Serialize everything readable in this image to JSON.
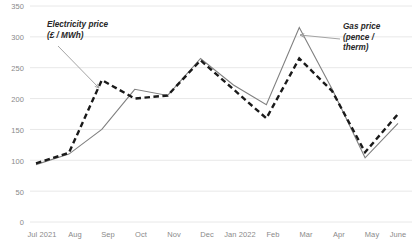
{
  "chart_data": {
    "type": "line",
    "title": "",
    "xlabel": "",
    "ylabel": "",
    "ylim": [
      0,
      350
    ],
    "yticks": [
      0,
      50,
      100,
      150,
      200,
      250,
      300,
      350
    ],
    "grid": true,
    "legend_position": "annotations",
    "categories": [
      "Jul 2021",
      "Aug",
      "Sep",
      "Oct",
      "Nov",
      "Dec",
      "Jan 2022",
      "Feb",
      "Mar",
      "Apr",
      "May",
      "June"
    ],
    "series": [
      {
        "name": "Gas price (pence / therm)",
        "style": "solid",
        "color": "#808080",
        "values": [
          93,
          110,
          150,
          215,
          205,
          265,
          222,
          190,
          315,
          215,
          104,
          160
        ]
      },
      {
        "name": "Electricity price (£ / MWh)",
        "style": "dashed",
        "color": "#1a1a1a",
        "values": [
          95,
          112,
          230,
          200,
          205,
          262,
          215,
          168,
          265,
          212,
          113,
          175
        ]
      }
    ],
    "annotations": [
      {
        "id": "electricity-annotation",
        "line1": "Electricity price",
        "line2": "(£ / MWh)",
        "target_category": "Sep"
      },
      {
        "id": "gas-annotation",
        "line1": "Gas price",
        "line2": "(pence /",
        "line3": "therm)",
        "target_category": "Mar"
      }
    ]
  },
  "axis": {
    "y_labels": [
      "350",
      "300",
      "250",
      "200",
      "150",
      "100",
      "50",
      "0"
    ],
    "x_labels": [
      "Jul 2021",
      "Aug",
      "Sep",
      "Oct",
      "Nov",
      "Dec",
      "Jan 2022",
      "Feb",
      "Mar",
      "Apr",
      "May",
      "June"
    ]
  },
  "colors": {
    "gas_line": "#808080",
    "electricity_line": "#1a1a1a",
    "gridline": "#e8e8e8",
    "tick_text": "#8a8a8a",
    "annotation_text": "#262626"
  }
}
